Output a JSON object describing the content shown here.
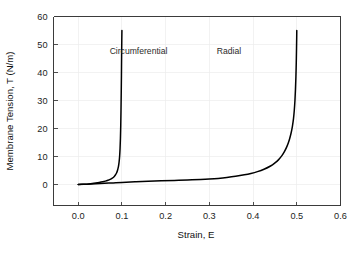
{
  "chart_data": {
    "type": "line",
    "title": "",
    "xlabel": "Strain, E",
    "ylabel": "Membrane Tension, T (N/m)",
    "xlim": [
      -0.0565,
      0.6
    ],
    "ylim": [
      -7.5,
      60
    ],
    "xticks": [
      0.0,
      0.1,
      0.2,
      0.3,
      0.4,
      0.5,
      0.6
    ],
    "xtick_labels": [
      "0.0",
      "0.1",
      "0.2",
      "0.3",
      "0.4",
      "0.5",
      "0.6"
    ],
    "yticks": [
      0,
      10,
      20,
      30,
      40,
      50,
      60
    ],
    "ytick_labels": [
      "0",
      "10",
      "20",
      "30",
      "40",
      "50",
      "60"
    ],
    "grid": true,
    "grid_color": "#ededed",
    "legend": "inline-annotations",
    "series": [
      {
        "name": "Circumferential",
        "color": "#000000",
        "annotation": {
          "text": "Circumferential",
          "x": 0.138,
          "y": 46.5
        },
        "points": [
          [
            0.0,
            0.0
          ],
          [
            0.008,
            0.05
          ],
          [
            0.016,
            0.12
          ],
          [
            0.024,
            0.22
          ],
          [
            0.032,
            0.34
          ],
          [
            0.04,
            0.5
          ],
          [
            0.048,
            0.7
          ],
          [
            0.056,
            0.95
          ],
          [
            0.062,
            1.2
          ],
          [
            0.068,
            1.52
          ],
          [
            0.073,
            1.85
          ],
          [
            0.078,
            2.3
          ],
          [
            0.082,
            2.8
          ],
          [
            0.085,
            3.4
          ],
          [
            0.088,
            4.2
          ],
          [
            0.09,
            5.1
          ],
          [
            0.092,
            6.4
          ],
          [
            0.0935,
            8.0
          ],
          [
            0.0948,
            10.2
          ],
          [
            0.0958,
            13.0
          ],
          [
            0.0966,
            16.5
          ],
          [
            0.0973,
            21.0
          ],
          [
            0.0979,
            26.5
          ],
          [
            0.0984,
            32.5
          ],
          [
            0.0989,
            39.0
          ],
          [
            0.0993,
            46.0
          ],
          [
            0.0997,
            51.5
          ],
          [
            0.1,
            55.0
          ]
        ]
      },
      {
        "name": "Radial",
        "color": "#000000",
        "annotation": {
          "text": "Radial",
          "x": 0.345,
          "y": 46.5
        },
        "points": [
          [
            0.0,
            0.0
          ],
          [
            0.02,
            0.12
          ],
          [
            0.04,
            0.26
          ],
          [
            0.06,
            0.42
          ],
          [
            0.08,
            0.58
          ],
          [
            0.1,
            0.74
          ],
          [
            0.13,
            0.96
          ],
          [
            0.16,
            1.14
          ],
          [
            0.19,
            1.3
          ],
          [
            0.22,
            1.45
          ],
          [
            0.25,
            1.6
          ],
          [
            0.28,
            1.78
          ],
          [
            0.3,
            1.95
          ],
          [
            0.32,
            2.18
          ],
          [
            0.34,
            2.5
          ],
          [
            0.36,
            2.92
          ],
          [
            0.38,
            3.45
          ],
          [
            0.395,
            3.95
          ],
          [
            0.41,
            4.6
          ],
          [
            0.425,
            5.45
          ],
          [
            0.44,
            6.6
          ],
          [
            0.45,
            7.7
          ],
          [
            0.458,
            8.8
          ],
          [
            0.466,
            10.3
          ],
          [
            0.472,
            11.8
          ],
          [
            0.478,
            13.8
          ],
          [
            0.483,
            16.0
          ],
          [
            0.487,
            18.4
          ],
          [
            0.49,
            20.8
          ],
          [
            0.4925,
            23.5
          ],
          [
            0.4943,
            26.5
          ],
          [
            0.4958,
            30.0
          ],
          [
            0.497,
            34.0
          ],
          [
            0.498,
            38.5
          ],
          [
            0.4988,
            43.5
          ],
          [
            0.4994,
            48.5
          ],
          [
            0.4998,
            52.5
          ],
          [
            0.5,
            55.0
          ]
        ]
      }
    ]
  }
}
